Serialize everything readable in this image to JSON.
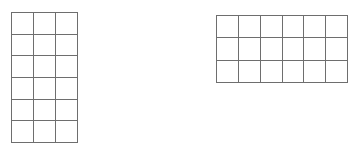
{
  "background_color": "#ffffff",
  "grid_line_color": "#6e6e6e",
  "grids": [
    {
      "label": "left-array-grid",
      "columns": 3,
      "rows": 6,
      "cell_count": 18,
      "x": 11,
      "y": 12,
      "width": 67,
      "height": 131
    },
    {
      "label": "right-array-grid",
      "columns": 6,
      "rows": 3,
      "cell_count": 18,
      "x": 216,
      "y": 15,
      "width": 132,
      "height": 68
    }
  ]
}
